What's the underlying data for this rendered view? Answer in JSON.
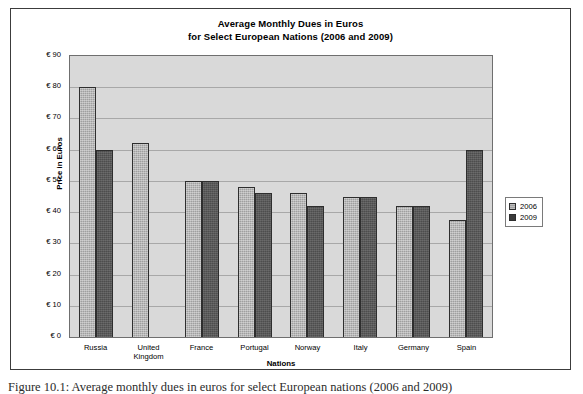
{
  "figure": {
    "caption": "Figure 10.1: Average monthly dues in euros for select European nations (2006 and 2009)"
  },
  "chart_data": {
    "type": "bar",
    "title": "Average Monthly Dues in Euros",
    "subtitle": "for Select European Nations (2006 and 2009)",
    "xlabel": "Nations",
    "ylabel": "Price in Euros",
    "categories": [
      "Russia",
      "United Kingdom",
      "France",
      "Portugal",
      "Norway",
      "Italy",
      "Germany",
      "Spain"
    ],
    "series": [
      {
        "name": "2006",
        "color": "#9f9f9f",
        "values": [
          80,
          62,
          50,
          48,
          46,
          45,
          42,
          37.5
        ]
      },
      {
        "name": "2009",
        "color": "#4d4d4d",
        "values": [
          60,
          0,
          50,
          46,
          42,
          45,
          42,
          60
        ]
      }
    ],
    "ylim": [
      0,
      90
    ],
    "ytick_step": 10,
    "ytick_labels": [
      "€ 90",
      "€ 80",
      "€ 70",
      "€ 60",
      "€ 50",
      "€ 40",
      "€ 30",
      "€ 20",
      "€ 10",
      "€ 0"
    ],
    "ytick_values": [
      90,
      80,
      70,
      60,
      50,
      40,
      30,
      20,
      10,
      0
    ],
    "grid": true,
    "legend_position": "right",
    "plot_background": "#d9d9d9"
  }
}
